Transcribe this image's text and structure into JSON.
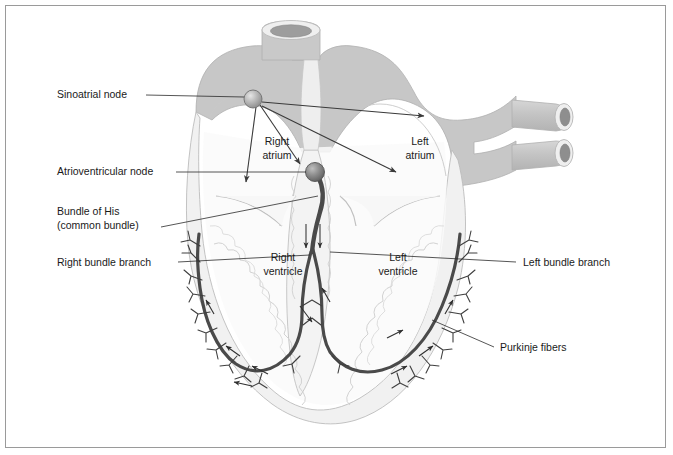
{
  "figure": {
    "border_color": "#9a9a9a",
    "background": "#ffffff"
  },
  "palette": {
    "myocardium_fill": "#f0f0f0",
    "myocardium_stroke": "#b9b9b9",
    "great_vessel_fill": "#c7c7c7",
    "great_vessel_stroke": "#b0b0b0",
    "vessel_lumen": "#8e8e8e",
    "conduction_path": "#4a4a4a",
    "purkinje_fiber": "#3f3f3f",
    "sa_node_fill": "#b5b5b5",
    "sa_node_stroke": "#6f6f6f",
    "av_node_fill": "#8a8a8a",
    "av_node_stroke": "#5a5a5a",
    "leader_line": "#2b2b2b",
    "arrow": "#3a3a3a",
    "text": "#1a1a1a"
  },
  "callout_labels": [
    {
      "id": "sinoatrial-node",
      "text": "Sinoatrial node",
      "side": "left",
      "x": 57,
      "y": 98
    },
    {
      "id": "atrioventricular-node",
      "text": "Atrioventricular node",
      "side": "left",
      "x": 57,
      "y": 175
    },
    {
      "id": "bundle-of-his-line1",
      "text": "Bundle of His",
      "side": "left",
      "x": 57,
      "y": 215
    },
    {
      "id": "bundle-of-his-line2",
      "text": "(common bundle)",
      "side": "left",
      "x": 57,
      "y": 228
    },
    {
      "id": "right-bundle-branch",
      "text": "Right bundle branch",
      "side": "left",
      "x": 57,
      "y": 265
    },
    {
      "id": "left-bundle-branch",
      "text": "Left bundle branch",
      "side": "right",
      "x": 523,
      "y": 265
    },
    {
      "id": "purkinje-fibers",
      "text": "Purkinje fibers",
      "side": "right",
      "x": 500,
      "y": 350
    }
  ],
  "chamber_labels": [
    {
      "id": "right-atrium",
      "line1": "Right",
      "line2": "atrium",
      "x": 277,
      "y": 145
    },
    {
      "id": "left-atrium",
      "line1": "Left",
      "line2": "atrium",
      "x": 420,
      "y": 145
    },
    {
      "id": "right-ventricle",
      "line1": "Right",
      "line2": "ventricle",
      "x": 283,
      "y": 261
    },
    {
      "id": "left-ventricle",
      "line1": "Left",
      "line2": "ventricle",
      "x": 398,
      "y": 261
    }
  ],
  "nodes": [
    {
      "id": "sa-node",
      "name": "sinoatrial-node-marker",
      "cx": 253,
      "cy": 99,
      "r": 9
    },
    {
      "id": "av-node",
      "name": "atrioventricular-node-marker",
      "cx": 315,
      "cy": 172,
      "r": 9
    }
  ],
  "great_vessels": [
    {
      "id": "aorta",
      "name": "aorta-opening"
    },
    {
      "id": "superior-pulmonary-vein",
      "name": "superior-pulmonary-vein-opening"
    },
    {
      "id": "inferior-pulmonary-vein",
      "name": "inferior-pulmonary-vein-opening"
    }
  ]
}
